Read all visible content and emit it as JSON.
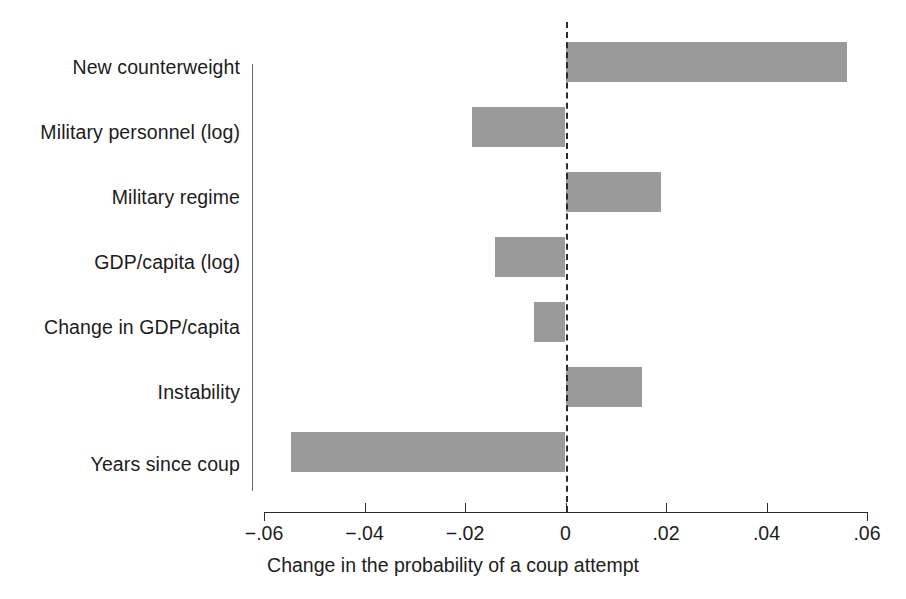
{
  "chart_data": {
    "type": "bar",
    "orientation": "horizontal",
    "title": "",
    "subtitle": "",
    "xlabel": "Change in the probability of a coup attempt",
    "ylabel": "",
    "xlim": [
      -0.06,
      0.06
    ],
    "xticks": [
      -0.06,
      -0.04,
      -0.02,
      0,
      0.02,
      0.04,
      0.06
    ],
    "xtick_labels": [
      "−.06",
      "−.04",
      "−.02",
      "0",
      ".02",
      ".04",
      ".06"
    ],
    "grid": false,
    "legend": null,
    "zero_reference_line": true,
    "zero_reference_line_style": "dashed",
    "bar_color": "#9a9a9a",
    "categories": [
      "New counterweight",
      "Military personnel (log)",
      "Military regime",
      "GDP/capita (log)",
      "Change in GDP/capita",
      "Instability",
      "Years since coup"
    ],
    "values": [
      0.0561,
      -0.0187,
      0.0191,
      -0.014,
      -0.0063,
      0.0153,
      -0.0547
    ],
    "series": [
      {
        "name": "Change in the probability of a coup attempt",
        "values": [
          0.0561,
          -0.0187,
          0.0191,
          -0.014,
          -0.0063,
          0.0153,
          -0.0547
        ]
      }
    ]
  },
  "axis": {
    "x_title": "Change in the probability of a coup attempt",
    "tick_0": "−.06",
    "tick_1": "−.04",
    "tick_2": "−.02",
    "tick_3": "0",
    "tick_4": ".02",
    "tick_5": ".04",
    "tick_6": ".06"
  },
  "categories": {
    "c0": "New counterweight",
    "c1": "Military personnel (log)",
    "c2": "Military regime",
    "c3": "GDP/capita (log)",
    "c4": "Change in GDP/capita",
    "c5": "Instability",
    "c6": "Years since coup"
  }
}
